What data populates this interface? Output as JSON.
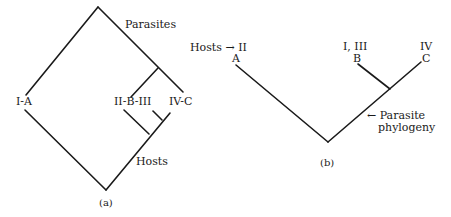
{
  "panel_a": {
    "caption": "(a)",
    "labels": {
      "parasites": "Parasites",
      "hosts": "Hosts",
      "taxon_1": "I-A",
      "taxon_2": "II-B-III",
      "taxon_3": "IV-C"
    }
  },
  "panel_b": {
    "caption": "(b)",
    "labels": {
      "hosts_pointer": "Hosts → II",
      "tip_a_top": "",
      "tip_a": "A",
      "tip_b_top": "I, III",
      "tip_b": "B",
      "tip_c_top": "IV",
      "tip_c": "C",
      "parasite_line1": "← Parasite",
      "parasite_line2": "phylogeny"
    }
  },
  "colors": {
    "line": "#1a1a1a",
    "background": "#ffffff"
  }
}
